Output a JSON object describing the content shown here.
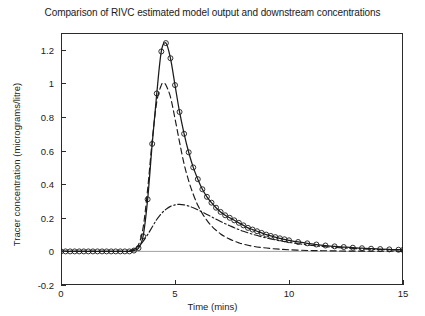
{
  "chart_data": {
    "type": "line",
    "title": "Comparison of RIVC estimated model output and downstream concentrations",
    "xlabel": "Time (mins)",
    "ylabel": "Tracer concentration (micrograms/litre)",
    "xlim": [
      0,
      15
    ],
    "ylim": [
      -0.2,
      1.3
    ],
    "xticks": [
      0,
      5,
      10,
      15
    ],
    "xtick_labels": [
      "0",
      "5",
      "10",
      "15"
    ],
    "yticks": [
      -0.2,
      0,
      0.2,
      0.4,
      0.6,
      0.8,
      1.0,
      1.2
    ],
    "ytick_labels": [
      "-0.2",
      "0",
      "0.2",
      "0.4",
      "0.6",
      "0.8",
      "1",
      "1.2"
    ],
    "grid": false,
    "legend": "none",
    "series": [
      {
        "name": "downstream concentration (measured)",
        "style": "solid-with-circle-markers",
        "color": "#1a1a1a",
        "marker": "circle-open",
        "x": [
          0.0,
          0.2,
          0.4,
          0.6,
          0.8,
          1.0,
          1.2,
          1.4,
          1.6,
          1.8,
          2.0,
          2.2,
          2.4,
          2.6,
          2.8,
          3.0,
          3.2,
          3.4,
          3.6,
          3.8,
          4.0,
          4.2,
          4.4,
          4.6,
          4.8,
          5.0,
          5.2,
          5.4,
          5.6,
          5.8,
          6.0,
          6.2,
          6.4,
          6.6,
          6.8,
          7.0,
          7.2,
          7.4,
          7.6,
          7.8,
          8.0,
          8.2,
          8.4,
          8.6,
          8.8,
          9.0,
          9.2,
          9.4,
          9.6,
          9.8,
          10.0,
          10.4,
          10.8,
          11.2,
          11.6,
          12.0,
          12.4,
          12.8,
          13.2,
          13.6,
          14.0,
          14.4,
          14.8,
          15.0
        ],
        "y": [
          0.0,
          0.0,
          0.0,
          0.0,
          0.0,
          0.0,
          0.0,
          0.0,
          0.0,
          0.0,
          0.0,
          0.0,
          0.0,
          0.0,
          0.0,
          0.0,
          0.005,
          0.02,
          0.09,
          0.31,
          0.64,
          0.94,
          1.19,
          1.24,
          1.15,
          0.99,
          0.83,
          0.7,
          0.59,
          0.5,
          0.43,
          0.37,
          0.325,
          0.29,
          0.26,
          0.235,
          0.215,
          0.2,
          0.185,
          0.17,
          0.155,
          0.14,
          0.13,
          0.12,
          0.11,
          0.1,
          0.092,
          0.085,
          0.078,
          0.072,
          0.066,
          0.056,
          0.048,
          0.041,
          0.035,
          0.03,
          0.026,
          0.022,
          0.019,
          0.016,
          0.014,
          0.012,
          0.01,
          0.009
        ]
      },
      {
        "name": "RIVC estimated model output",
        "style": "dashed",
        "color": "#1a1a1a",
        "marker": "none",
        "x": [
          0.0,
          0.5,
          1.0,
          1.5,
          2.0,
          2.5,
          3.0,
          3.2,
          3.4,
          3.6,
          3.8,
          4.0,
          4.2,
          4.4,
          4.5,
          4.6,
          4.8,
          5.0,
          5.2,
          5.4,
          5.6,
          5.8,
          6.0,
          6.2,
          6.4,
          6.6,
          6.8,
          7.0,
          7.2,
          7.4,
          7.6,
          7.8,
          8.0,
          8.4,
          8.8,
          9.2,
          9.6,
          10.0,
          10.5,
          11.0,
          11.5,
          12.0,
          12.5,
          13.0,
          13.5,
          14.0,
          14.5,
          15.0
        ],
        "y": [
          0.0,
          0.0,
          0.0,
          0.0,
          0.0,
          0.0,
          0.0,
          0.01,
          0.04,
          0.14,
          0.37,
          0.66,
          0.89,
          0.99,
          1.0,
          0.99,
          0.92,
          0.79,
          0.65,
          0.52,
          0.42,
          0.34,
          0.275,
          0.225,
          0.185,
          0.152,
          0.126,
          0.104,
          0.087,
          0.073,
          0.061,
          0.051,
          0.043,
          0.031,
          0.023,
          0.017,
          0.013,
          0.01,
          0.007,
          0.005,
          0.004,
          0.003,
          0.002,
          0.002,
          0.001,
          0.001,
          0.001,
          0.0
        ]
      },
      {
        "name": "upstream / secondary component",
        "style": "dash-dot",
        "color": "#1a1a1a",
        "marker": "none",
        "x": [
          0.0,
          1.0,
          2.0,
          2.8,
          3.0,
          3.2,
          3.4,
          3.6,
          3.8,
          4.0,
          4.2,
          4.4,
          4.6,
          4.8,
          5.0,
          5.2,
          5.4,
          5.6,
          5.8,
          6.0,
          6.2,
          6.4,
          6.6,
          6.8,
          7.0,
          7.2,
          7.4,
          7.6,
          7.8,
          8.0,
          8.4,
          8.8,
          9.2,
          9.6,
          10.0,
          10.5,
          11.0,
          11.5,
          12.0,
          12.5,
          13.0,
          13.5,
          14.0,
          14.5,
          15.0
        ],
        "y": [
          0.0,
          0.0,
          0.0,
          0.0,
          0.004,
          0.012,
          0.03,
          0.06,
          0.1,
          0.145,
          0.19,
          0.225,
          0.25,
          0.268,
          0.277,
          0.28,
          0.277,
          0.27,
          0.26,
          0.248,
          0.234,
          0.22,
          0.206,
          0.192,
          0.178,
          0.165,
          0.153,
          0.141,
          0.13,
          0.12,
          0.102,
          0.087,
          0.074,
          0.063,
          0.054,
          0.044,
          0.036,
          0.029,
          0.024,
          0.02,
          0.016,
          0.013,
          0.011,
          0.009,
          0.008
        ]
      }
    ]
  }
}
